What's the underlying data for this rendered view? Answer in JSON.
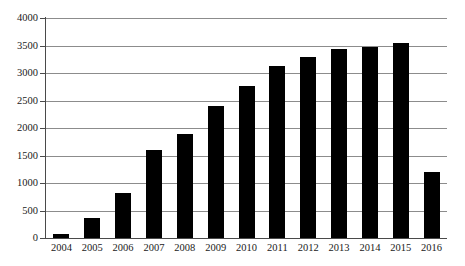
{
  "chart_data": {
    "type": "bar",
    "title": "",
    "subtitle": "",
    "xlabel": "",
    "ylabel": "",
    "categories": [
      "2004",
      "2005",
      "2006",
      "2007",
      "2008",
      "2009",
      "2010",
      "2011",
      "2012",
      "2013",
      "2014",
      "2015",
      "2016"
    ],
    "values": [
      75,
      370,
      810,
      1600,
      1900,
      2400,
      2760,
      3120,
      3290,
      3430,
      3470,
      3550,
      1200
    ],
    "series": [
      {
        "name": "",
        "values": [
          75,
          370,
          810,
          1600,
          1900,
          2400,
          2760,
          3120,
          3290,
          3430,
          3470,
          3550,
          1200
        ]
      }
    ],
    "ylim": [
      0,
      4000
    ],
    "yticks": [
      0,
      500,
      1000,
      1500,
      2000,
      2500,
      3000,
      3500,
      4000
    ],
    "ytick_labels": [
      "0",
      "500",
      "1000",
      "1500",
      "2000",
      "2500",
      "3000",
      "3500",
      "4000"
    ],
    "grid": true,
    "grid_axis": "y",
    "legend": false,
    "legend_position": "none",
    "bar_color": "#000000",
    "grid_color": "#8c8c8c",
    "axis_color": "#4a4a4a",
    "background_color": "#ffffff",
    "annotations": []
  }
}
